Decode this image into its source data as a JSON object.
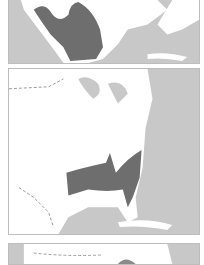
{
  "figure": {
    "panels": [
      {
        "id": "map-1",
        "region": "Mexico and southwestern United States",
        "highlighted_range": "Mexico / southern Texas"
      },
      {
        "id": "map-2",
        "region": "Eastern United States",
        "highlighted_range": "Southeastern United States"
      },
      {
        "id": "map-3",
        "region": "North America (partially visible)",
        "highlighted_range": ""
      }
    ],
    "colors": {
      "land": "#ffffff",
      "water": "#c8c8c8",
      "range": "#6e6e6e",
      "border": "#bdbdbd",
      "boundary_dash": "#9a9a9a"
    }
  }
}
